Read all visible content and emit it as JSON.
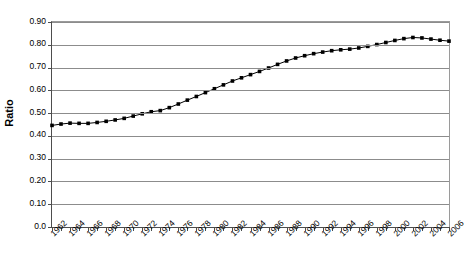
{
  "chart_data": {
    "type": "line",
    "title": "",
    "subtitle": "",
    "xlabel": "",
    "ylabel": "Ratio",
    "ylim": [
      0.0,
      0.9
    ],
    "xlim": [
      1962,
      2006
    ],
    "grid": true,
    "legend": false,
    "marker": "square",
    "line_color": "#000000",
    "marker_color": "#000000",
    "grid_color": "#8c8c8c",
    "axis_color": "#4d4d4d",
    "ytick_labels": [
      "0.90",
      "0.80",
      "0.70",
      "0.60",
      "0.50",
      "0.40",
      "0.30",
      "0.20",
      "0.10",
      "0.0"
    ],
    "ytick_values": [
      0.9,
      0.8,
      0.7,
      0.6,
      0.5,
      0.4,
      0.3,
      0.2,
      0.1,
      0.0
    ],
    "xtick_labels": [
      "1962",
      "1964",
      "1966",
      "1968",
      "1970",
      "1972",
      "1974",
      "1976",
      "1978",
      "1980",
      "1982",
      "1984",
      "1986",
      "1988",
      "1990",
      "1992",
      "1994",
      "1996",
      "1998",
      "2000",
      "2002",
      "2004",
      "2006"
    ],
    "xtick_values": [
      1962,
      1964,
      1966,
      1968,
      1970,
      1972,
      1974,
      1976,
      1978,
      1980,
      1982,
      1984,
      1986,
      1988,
      1990,
      1992,
      1994,
      1996,
      1998,
      2000,
      2002,
      2004,
      2006
    ],
    "x": [
      1962,
      1963,
      1964,
      1965,
      1966,
      1967,
      1968,
      1969,
      1970,
      1971,
      1972,
      1973,
      1974,
      1975,
      1976,
      1977,
      1978,
      1979,
      1980,
      1981,
      1982,
      1983,
      1984,
      1985,
      1986,
      1987,
      1988,
      1989,
      1990,
      1991,
      1992,
      1993,
      1994,
      1995,
      1996,
      1997,
      1998,
      1999,
      2000,
      2001,
      2002,
      2003,
      2004,
      2005,
      2006
    ],
    "values": [
      0.446,
      0.452,
      0.456,
      0.455,
      0.455,
      0.459,
      0.464,
      0.47,
      0.477,
      0.487,
      0.497,
      0.506,
      0.511,
      0.524,
      0.54,
      0.557,
      0.573,
      0.59,
      0.607,
      0.624,
      0.641,
      0.655,
      0.669,
      0.683,
      0.698,
      0.714,
      0.729,
      0.742,
      0.752,
      0.761,
      0.768,
      0.774,
      0.778,
      0.781,
      0.786,
      0.793,
      0.801,
      0.81,
      0.819,
      0.827,
      0.832,
      0.83,
      0.825,
      0.82,
      0.816
    ]
  }
}
